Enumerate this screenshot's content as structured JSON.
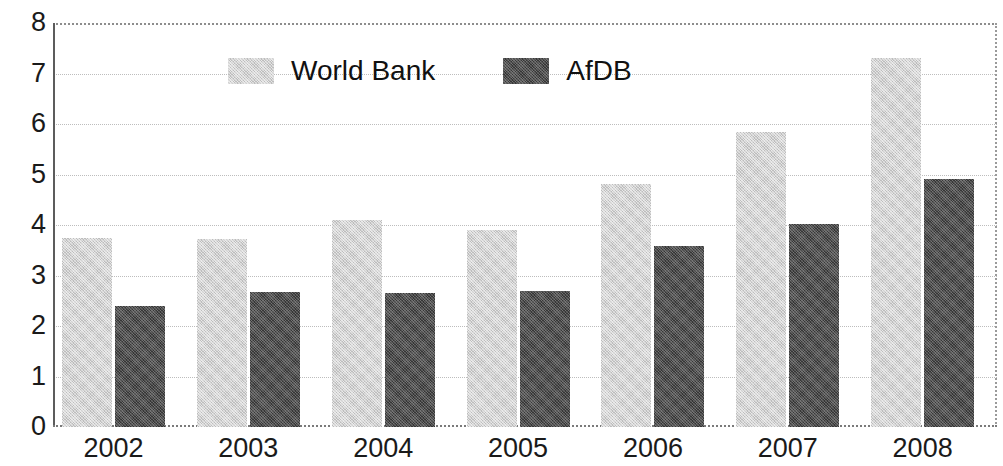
{
  "chart_data": {
    "type": "bar",
    "title": "",
    "subtitle": "",
    "xlabel": "",
    "ylabel": "",
    "categories": [
      "2002",
      "2003",
      "2004",
      "2005",
      "2006",
      "2007",
      "2008"
    ],
    "series": [
      {
        "name": "World Bank",
        "color": "#d2d2d2",
        "values": [
          3.75,
          3.72,
          4.1,
          3.9,
          4.82,
          5.85,
          7.3
        ]
      },
      {
        "name": "AfDB",
        "color": "#4e4e4e",
        "values": [
          2.4,
          2.68,
          2.65,
          2.7,
          3.58,
          4.02,
          4.92
        ]
      }
    ],
    "ylim": [
      0,
      8
    ],
    "ytick_labels": [
      "8",
      "7",
      "6",
      "5",
      "4",
      "3",
      "2",
      "1",
      "0"
    ],
    "ytick_values": [
      8,
      7,
      6,
      5,
      4,
      3,
      2,
      1,
      0
    ],
    "grid": true,
    "grid_axis": "y",
    "legend_position": "top-center",
    "legend_entries": [
      "World Bank",
      "AfDB"
    ]
  },
  "axis": {
    "y_label_color": "#1a1a1a",
    "x_label_color": "#1a1a1a",
    "grid_color": "#bdbdbd",
    "frame_color": "#5c5c5c"
  },
  "legend": {
    "items": [
      {
        "label": "World Bank",
        "swatch": "#d2d2d2"
      },
      {
        "label": "AfDB",
        "swatch": "#4e4e4e"
      }
    ]
  }
}
